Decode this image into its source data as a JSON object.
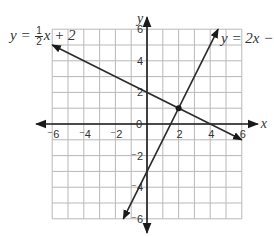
{
  "chart_data": {
    "type": "line",
    "title": "",
    "xlabel": "x",
    "ylabel": "y",
    "xlim": [
      -6,
      6
    ],
    "ylim": [
      -6,
      6
    ],
    "grid": true,
    "grid_step": 1,
    "x_tick_labels": [
      "⁻6",
      "⁻4",
      "⁻2",
      "0",
      "2",
      "4",
      "6"
    ],
    "y_tick_labels": [
      "6",
      "4",
      "2",
      "⁻2",
      "⁻4",
      "⁻6"
    ],
    "series": [
      {
        "name": "y = -1/2 x + 2",
        "equation_label": "y = −(1/2)x + 2",
        "slope": -0.5,
        "intercept": 2,
        "x": [
          -6,
          6
        ],
        "y": [
          5,
          -1
        ]
      },
      {
        "name": "y = 2x - 3",
        "equation_label": "y = 2x −",
        "slope": 2,
        "intercept": -3,
        "x": [
          -1.5,
          4.5
        ],
        "y": [
          -6,
          6
        ]
      }
    ],
    "intersection": {
      "x": 2,
      "y": 1
    },
    "annotations": [
      "y = − 1/2 x + 2",
      "y = 2x −"
    ]
  },
  "labels": {
    "eq1_prefix": "y = ",
    "eq1_num": "1",
    "eq1_den": "2",
    "eq1_suffix": "x + 2",
    "eq2": "y = 2x −",
    "x_axis": "x",
    "y_axis": "y"
  },
  "colors": {
    "grid": "#b8b8b8",
    "axis": "#1a1a1a",
    "line": "#2a2a2a",
    "text": "#333333"
  }
}
